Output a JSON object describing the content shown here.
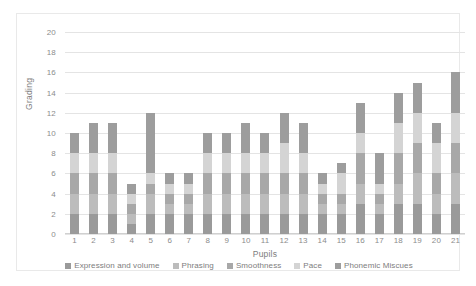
{
  "chart_data": {
    "type": "bar",
    "stacked": true,
    "title": "",
    "xlabel": "Pupils",
    "ylabel": "Grading",
    "ylim": [
      0,
      20
    ],
    "ytick_step": 2,
    "yticks": [
      0,
      2,
      4,
      6,
      8,
      10,
      12,
      14,
      16,
      18,
      20
    ],
    "grid": true,
    "legend_position": "bottom",
    "categories": [
      "1",
      "2",
      "3",
      "4",
      "5",
      "6",
      "7",
      "8",
      "9",
      "10",
      "11",
      "12",
      "13",
      "14",
      "15",
      "16",
      "17",
      "18",
      "19",
      "20",
      "21"
    ],
    "series": [
      {
        "name": "Expression and volume",
        "color": "#9a9a9a",
        "values": [
          2,
          2,
          2,
          1,
          2,
          2,
          2,
          2,
          2,
          2,
          2,
          2,
          2,
          2,
          2,
          3,
          2,
          3,
          3,
          2,
          3
        ]
      },
      {
        "name": "Phrasing",
        "color": "#bcbcbc",
        "values": [
          2,
          2,
          2,
          1,
          2,
          1,
          1,
          2,
          2,
          2,
          2,
          2,
          2,
          1,
          1,
          2,
          1,
          2,
          3,
          2,
          3
        ]
      },
      {
        "name": "Smoothness",
        "color": "#a8a8a8",
        "values": [
          2,
          2,
          2,
          1,
          1,
          1,
          1,
          2,
          2,
          2,
          2,
          2,
          2,
          1,
          1,
          3,
          1,
          3,
          3,
          2,
          3
        ]
      },
      {
        "name": "Pace",
        "color": "#d4d4d4",
        "values": [
          2,
          2,
          2,
          1,
          1,
          1,
          1,
          2,
          2,
          2,
          2,
          3,
          2,
          1,
          2,
          2,
          1,
          3,
          3,
          3,
          3
        ]
      },
      {
        "name": "Phonemic Miscues",
        "color": "#9d9d9d",
        "values": [
          2,
          3,
          3,
          1,
          6,
          1,
          1,
          2,
          2,
          3,
          2,
          3,
          3,
          1,
          1,
          3,
          3,
          3,
          3,
          2,
          4
        ]
      }
    ],
    "totals": [
      10,
      11,
      11,
      5,
      12,
      6,
      6,
      10,
      10,
      11,
      10,
      12,
      11,
      6,
      7,
      13,
      8,
      14,
      15,
      11,
      16
    ],
    "annotations": []
  },
  "axes": {
    "y_title": "Grading",
    "x_title": "Pupils"
  }
}
